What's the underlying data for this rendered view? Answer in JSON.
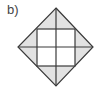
{
  "figure": {
    "label": "b)",
    "colors": {
      "shade": "#e2e2e2",
      "line": "#3a3a3a",
      "background": "#ffffff"
    },
    "diamond": {
      "top": [
        56,
        8
      ],
      "right": [
        93,
        47
      ],
      "bottom": [
        56,
        86
      ],
      "left": [
        18,
        47
      ]
    },
    "inner_square": {
      "x": 37,
      "y": 29,
      "width": 38,
      "height": 37
    },
    "grid": {
      "center_x": 56,
      "center_y": 47
    }
  }
}
